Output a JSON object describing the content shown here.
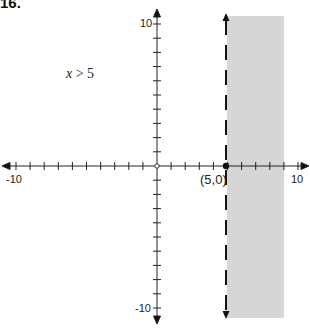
{
  "problem": {
    "number": "16."
  },
  "chart_data": {
    "type": "line",
    "title": "",
    "inequality": "x > 5",
    "inequality_var": "x",
    "inequality_rest": "> 5",
    "boundary": {
      "x": 5,
      "style": "dashed"
    },
    "shaded_region": {
      "x_min": 5,
      "x_max": 9.2,
      "y_min": -10.6,
      "y_max": 10.3,
      "color": "#d6d6d6"
    },
    "point": {
      "x": 5,
      "y": 0,
      "label": "(5,0)"
    },
    "xlim": [
      -10,
      10
    ],
    "ylim": [
      -10,
      10
    ],
    "x_tick_labels": [
      "-10",
      "10"
    ],
    "y_tick_labels": [
      "10",
      "-10"
    ],
    "tick_step": 1,
    "xlabel": "",
    "ylabel": ""
  }
}
